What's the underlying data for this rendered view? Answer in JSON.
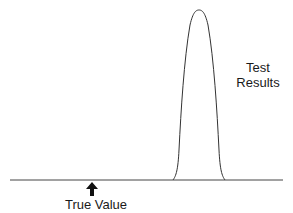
{
  "diagram": {
    "title": "",
    "labels": {
      "test_results_line1": "Test",
      "test_results_line2": "Results",
      "true_value": "True Value"
    },
    "elements": {
      "baseline": "horizontal axis line",
      "curve": "narrow bell-shaped distribution of test results, far right of true value",
      "arrow": "upward arrow marking the true value"
    },
    "colors": {
      "line": "#333333",
      "text": "#1a1a1a",
      "background": "#ffffff"
    }
  }
}
